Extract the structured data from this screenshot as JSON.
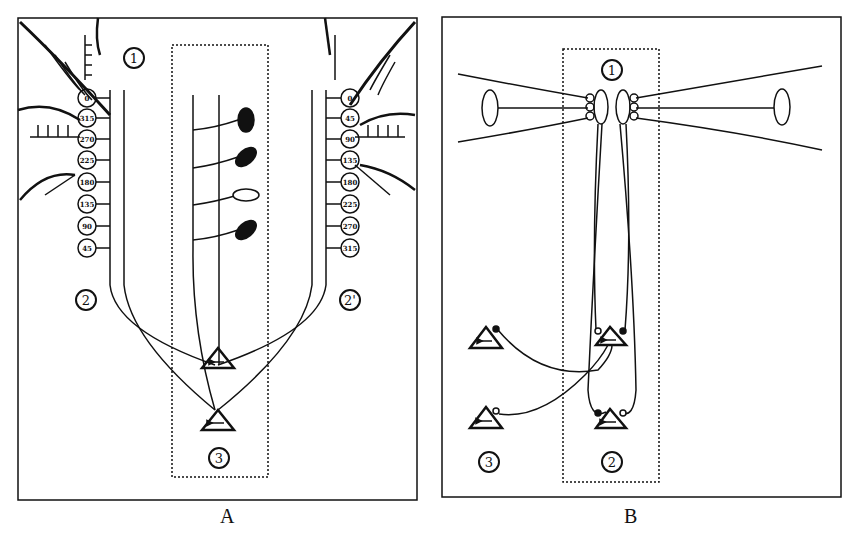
{
  "panels": [
    {
      "id": "A",
      "caption": "A",
      "region_labels": {
        "r1": "1",
        "r2": "2",
        "r2p": "2'",
        "r3": "3"
      },
      "left_column_labels": [
        "0",
        "315",
        "270",
        "225",
        "180",
        "135",
        "90",
        "45"
      ],
      "right_column_labels": [
        "0",
        "45",
        "90",
        "135",
        "180",
        "225",
        "270",
        "315"
      ],
      "triangle_arrows": [
        "left",
        "right"
      ]
    },
    {
      "id": "B",
      "caption": "B",
      "region_labels": {
        "r1": "1",
        "r2": "2",
        "r3": "3"
      },
      "triangle_arrows": [
        "left",
        "left",
        "right",
        "right"
      ]
    }
  ],
  "colors": {
    "ink": "#111111",
    "background": "#ffffff"
  }
}
